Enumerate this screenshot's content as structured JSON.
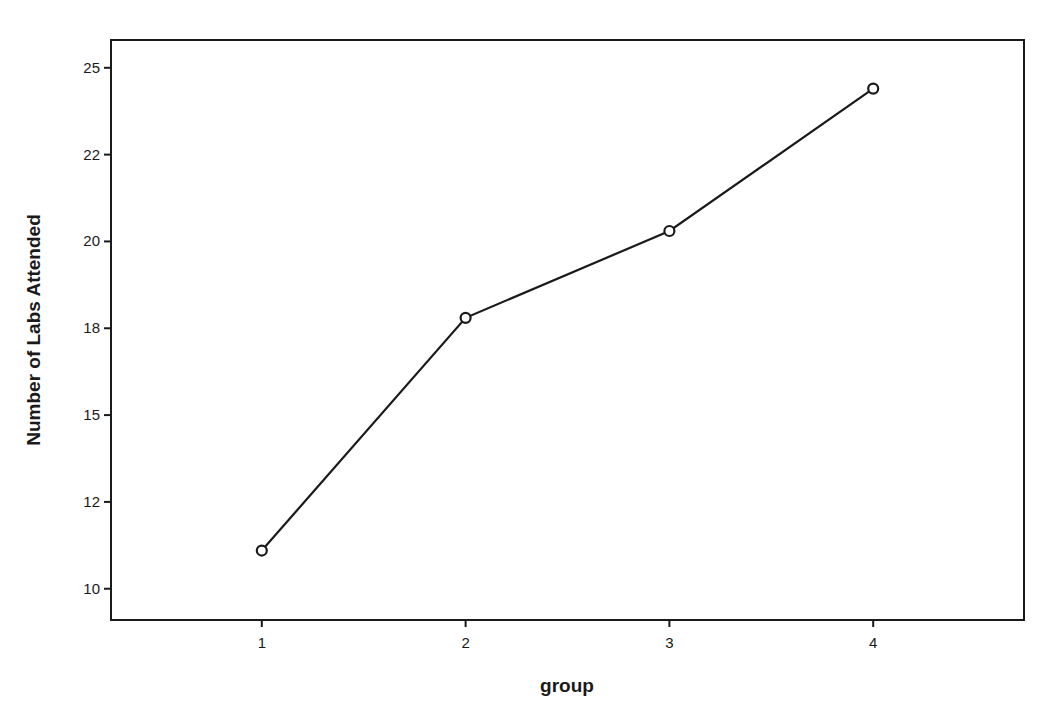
{
  "chart_data": {
    "type": "line",
    "title": "",
    "xlabel": "group",
    "ylabel": "Number of Labs Attended",
    "categories": [
      "1",
      "2",
      "3",
      "4"
    ],
    "series": [
      {
        "name": "Number of Labs Attended",
        "values": [
          11.1,
          17.8,
          20.3,
          24.4
        ],
        "marker": "circle-open"
      }
    ],
    "yticks": [
      {
        "value": 10,
        "label": "10"
      },
      {
        "value": 12.5,
        "label": "12"
      },
      {
        "value": 15,
        "label": "15"
      },
      {
        "value": 17.5,
        "label": "18"
      },
      {
        "value": 20,
        "label": "20"
      },
      {
        "value": 22.5,
        "label": "22"
      },
      {
        "value": 25,
        "label": "25"
      }
    ],
    "ylim": [
      9.1,
      25.8
    ],
    "xlim": [
      0.26,
      4.74
    ],
    "grid": false,
    "legend": "none",
    "colors": {
      "line": "#1a1a1a",
      "frame": "#1a1a1a",
      "background": "#ffffff"
    }
  }
}
